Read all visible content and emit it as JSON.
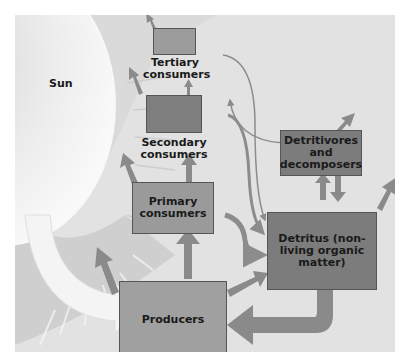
{
  "diagram": {
    "colors": {
      "background": "#e2e2e2",
      "sun_fill": "#f0f0f0",
      "sun_rays": "#b8b8b8",
      "box_light": "#9a9a9a",
      "box_dark": "#7c7c7c",
      "arrow": "#8a8a8a",
      "thin_line": "#8c8c8c"
    },
    "nodes": {
      "sun": {
        "label": "Sun"
      },
      "tertiary": {
        "label": "Tertiary consumers"
      },
      "secondary": {
        "label": "Secondary consumers"
      },
      "primary": {
        "label": "Primary consumers"
      },
      "producers": {
        "label": "Producers"
      },
      "detritivores": {
        "label": "Detritivores and decomposers"
      },
      "detritus": {
        "label": "Detritus (non-living organic matter)"
      }
    },
    "edges": [
      {
        "from": "sun",
        "to": "producers",
        "type": "light energy (wide pale arrow)"
      },
      {
        "from": "producers",
        "to": "primary"
      },
      {
        "from": "primary",
        "to": "secondary"
      },
      {
        "from": "secondary",
        "to": "tertiary"
      },
      {
        "from": "producers",
        "to": "detritus"
      },
      {
        "from": "primary",
        "to": "detritus"
      },
      {
        "from": "secondary",
        "to": "detritus"
      },
      {
        "from": "tertiary",
        "to": "detritus"
      },
      {
        "from": "detritivores",
        "to": "secondary"
      },
      {
        "from": "detritus",
        "to": "detritivores"
      },
      {
        "from": "detritivores",
        "to": "detritus"
      },
      {
        "from": "detritus",
        "to": "producers",
        "type": "nutrient return (wide arrow)"
      },
      {
        "from": "producers",
        "to": "out",
        "type": "heat loss"
      },
      {
        "from": "primary",
        "to": "out",
        "type": "heat loss"
      },
      {
        "from": "secondary",
        "to": "out",
        "type": "heat loss"
      },
      {
        "from": "tertiary",
        "to": "out",
        "type": "heat loss"
      },
      {
        "from": "detritivores",
        "to": "out",
        "type": "heat loss"
      },
      {
        "from": "detritus",
        "to": "out",
        "type": "heat loss"
      }
    ]
  }
}
